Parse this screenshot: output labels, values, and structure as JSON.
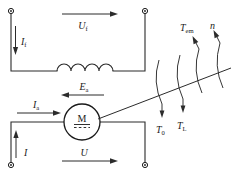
{
  "diagram": {
    "colors": {
      "wire": "#2b2b2b",
      "label": "#1a1a1a",
      "background": "#ffffff",
      "terminal_fill": "#ffffff",
      "terminal_stroke": "#1a1a1a"
    },
    "labels": {
      "field_voltage": "U",
      "field_voltage_sub": "f",
      "field_current": "I",
      "field_current_sub": "f",
      "armature_current": "I",
      "armature_current_sub": "a",
      "back_emf": "E",
      "back_emf_sub": "a",
      "line_current": "I",
      "terminal_voltage": "U",
      "no_load_torque": "T",
      "no_load_torque_sub": "0",
      "load_torque": "T",
      "load_torque_sub": "L",
      "electromagnetic_torque": "T",
      "electromagnetic_torque_sub": "em",
      "speed": "n",
      "motor_symbol": "M"
    },
    "terminals": [
      {
        "name": "field-top-left",
        "x": 11,
        "y": 11
      },
      {
        "name": "field-top-right",
        "x": 145,
        "y": 11
      },
      {
        "name": "armature-bottom-left",
        "x": 11,
        "y": 165
      },
      {
        "name": "armature-bottom-right",
        "x": 145,
        "y": 165
      }
    ],
    "components": {
      "field_winding": {
        "humps": 4,
        "x_start": 57,
        "x_end": 113,
        "y": 71
      },
      "motor": {
        "cx": 82,
        "cy": 122,
        "r": 18
      },
      "shaft": {
        "x1": 100,
        "y1": 118,
        "x2": 230,
        "y2": 68
      },
      "arcs_count": 4
    }
  }
}
